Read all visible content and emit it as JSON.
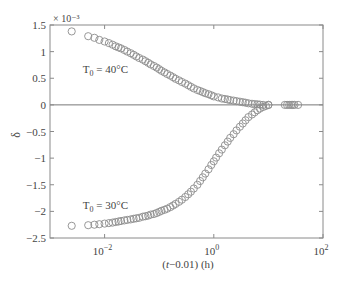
{
  "chart_data": {
    "type": "scatter",
    "title": "",
    "xlabel": "(t−0.01) (h)",
    "ylabel": "δ",
    "y_multiplier": "× 10⁻³",
    "xscale": "log",
    "xlim": [
      0.001,
      100
    ],
    "ylim": [
      -2.5,
      1.5
    ],
    "x_ticks": [
      {
        "value": 0.01,
        "label": "10",
        "exp": "−2"
      },
      {
        "value": 1,
        "label": "10",
        "exp": "0"
      },
      {
        "value": 100,
        "label": "10",
        "exp": "2"
      }
    ],
    "y_ticks": [
      {
        "value": 1.5,
        "label": "1.5"
      },
      {
        "value": 1,
        "label": "1"
      },
      {
        "value": 0.5,
        "label": "0.5"
      },
      {
        "value": 0,
        "label": "0"
      },
      {
        "value": -0.5,
        "label": "−0.5"
      },
      {
        "value": -1,
        "label": "−1"
      },
      {
        "value": -1.5,
        "label": "−1.5"
      },
      {
        "value": -2,
        "label": "−2"
      },
      {
        "value": -2.5,
        "label": "−2.5"
      }
    ],
    "grid": false,
    "legend": "none",
    "zero_line": true,
    "marker": "open-circle",
    "annotations": [
      {
        "text": "T",
        "sub": "0",
        "rest": " = 40°C",
        "x": 0.004,
        "y": 0.6
      },
      {
        "text": "T",
        "sub": "0",
        "rest": " = 30°C",
        "x": 0.004,
        "y": -1.95
      }
    ],
    "series": [
      {
        "name": "T0 = 40°C",
        "x": [
          0.0025,
          0.005,
          0.0065,
          0.008,
          0.01,
          0.012,
          0.014,
          0.016,
          0.018,
          0.02,
          0.023,
          0.026,
          0.03,
          0.034,
          0.038,
          0.043,
          0.05,
          0.056,
          0.063,
          0.07,
          0.08,
          0.09,
          0.1,
          0.11,
          0.125,
          0.14,
          0.16,
          0.18,
          0.2,
          0.23,
          0.26,
          0.3,
          0.34,
          0.38,
          0.43,
          0.5,
          0.56,
          0.63,
          0.7,
          0.8,
          0.9,
          1.0,
          1.2,
          1.4,
          1.6,
          1.8,
          2.0,
          2.3,
          2.6,
          3.0,
          3.4,
          3.8,
          4.3,
          5.0,
          5.6,
          6.3,
          7.0,
          8.0,
          10.0,
          20.0,
          22.0,
          24.0,
          26.0,
          28.0,
          30.0,
          35.0
        ],
        "y": [
          1.38,
          1.29,
          1.26,
          1.22,
          1.19,
          1.16,
          1.13,
          1.1,
          1.08,
          1.06,
          1.03,
          1.0,
          0.97,
          0.94,
          0.91,
          0.88,
          0.85,
          0.82,
          0.79,
          0.76,
          0.73,
          0.7,
          0.67,
          0.64,
          0.61,
          0.58,
          0.55,
          0.52,
          0.49,
          0.46,
          0.43,
          0.4,
          0.37,
          0.34,
          0.31,
          0.28,
          0.26,
          0.24,
          0.22,
          0.2,
          0.18,
          0.16,
          0.14,
          0.12,
          0.11,
          0.1,
          0.09,
          0.08,
          0.07,
          0.06,
          0.05,
          0.04,
          0.03,
          0.02,
          0.015,
          0.01,
          0.005,
          0.0,
          0.0,
          0.0,
          0.0,
          0.0,
          0.0,
          0.0,
          0.0,
          0.0
        ]
      },
      {
        "name": "T0 = 30°C",
        "x": [
          0.0025,
          0.005,
          0.0065,
          0.008,
          0.01,
          0.012,
          0.014,
          0.016,
          0.018,
          0.02,
          0.023,
          0.026,
          0.03,
          0.034,
          0.038,
          0.043,
          0.05,
          0.056,
          0.063,
          0.07,
          0.08,
          0.09,
          0.1,
          0.11,
          0.125,
          0.14,
          0.16,
          0.18,
          0.2,
          0.23,
          0.26,
          0.3,
          0.34,
          0.38,
          0.43,
          0.5,
          0.56,
          0.63,
          0.7,
          0.8,
          0.9,
          1.0,
          1.1,
          1.25,
          1.4,
          1.6,
          1.8,
          2.0,
          2.3,
          2.6,
          3.0,
          3.4,
          3.8,
          4.3,
          5.0,
          5.6,
          6.3,
          7.0,
          8.0,
          9.0,
          10.0
        ],
        "y": [
          -2.27,
          -2.26,
          -2.25,
          -2.24,
          -2.23,
          -2.22,
          -2.21,
          -2.2,
          -2.19,
          -2.18,
          -2.17,
          -2.16,
          -2.15,
          -2.14,
          -2.13,
          -2.12,
          -2.1,
          -2.09,
          -2.08,
          -2.06,
          -2.05,
          -2.03,
          -2.01,
          -1.99,
          -1.97,
          -1.95,
          -1.92,
          -1.89,
          -1.86,
          -1.82,
          -1.78,
          -1.73,
          -1.68,
          -1.63,
          -1.57,
          -1.5,
          -1.43,
          -1.36,
          -1.29,
          -1.21,
          -1.13,
          -1.06,
          -0.99,
          -0.91,
          -0.84,
          -0.76,
          -0.69,
          -0.62,
          -0.55,
          -0.48,
          -0.41,
          -0.35,
          -0.29,
          -0.23,
          -0.18,
          -0.14,
          -0.1,
          -0.07,
          -0.04,
          -0.02,
          0.0
        ]
      }
    ]
  }
}
